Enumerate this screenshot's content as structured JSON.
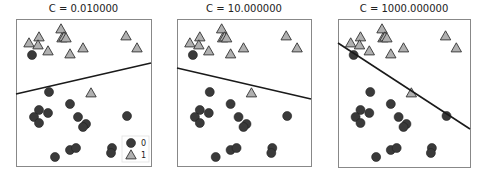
{
  "chart_data": [
    {
      "type": "scatter",
      "title": "C = 0.010000",
      "legend": [
        {
          "label": "0",
          "marker": "circle"
        },
        {
          "label": "1",
          "marker": "triangle"
        }
      ],
      "legend_position": "lower right",
      "decision_boundary": {
        "x0": 0,
        "y0": 75,
        "x1": 135,
        "y1": 44
      },
      "frame": {
        "x": 16,
        "y": 19,
        "w": 135,
        "h": 147
      }
    },
    {
      "type": "scatter",
      "title": "C = 10.000000",
      "decision_boundary": {
        "x0": 0,
        "y0": 49,
        "x1": 134,
        "y1": 80
      },
      "frame": {
        "x": 177,
        "y": 19,
        "w": 134,
        "h": 147
      }
    },
    {
      "type": "scatter",
      "title": "C = 1000.000000",
      "decision_boundary": {
        "x0": 0,
        "y0": 24,
        "x1": 132,
        "y1": 110
      },
      "frame": {
        "x": 338,
        "y": 19,
        "w": 132,
        "h": 148
      }
    }
  ],
  "points": {
    "class_1_triangles": [
      [
        13,
        24
      ],
      [
        23,
        18
      ],
      [
        22,
        26
      ],
      [
        45,
        10
      ],
      [
        46,
        19
      ],
      [
        48,
        18
      ],
      [
        50,
        19
      ],
      [
        32,
        32
      ],
      [
        54,
        35
      ],
      [
        67,
        29
      ],
      [
        110,
        17
      ],
      [
        121,
        29
      ],
      [
        75,
        74
      ]
    ],
    "class_0_circles": [
      [
        16,
        36
      ],
      [
        33,
        73
      ],
      [
        54,
        85
      ],
      [
        23,
        91
      ],
      [
        18,
        98
      ],
      [
        32,
        94
      ],
      [
        23,
        104
      ],
      [
        62,
        98
      ],
      [
        70,
        105
      ],
      [
        67,
        108
      ],
      [
        111,
        97
      ],
      [
        54,
        131
      ],
      [
        60,
        129
      ],
      [
        39,
        138
      ],
      [
        96,
        129
      ],
      [
        95,
        134
      ]
    ]
  },
  "colors": {
    "circle": "#3a3a3a",
    "triangle": "#b0b0b0",
    "line": "#1a1a1a",
    "frame": "#888888"
  }
}
